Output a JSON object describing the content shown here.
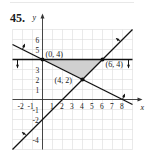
{
  "problem_number": "45.",
  "chart_data": {
    "type": "line",
    "title": "",
    "xlabel": "x",
    "ylabel": "y",
    "xlim": [
      -3,
      9
    ],
    "ylim": [
      -5,
      7
    ],
    "grid": true,
    "x_ticks": [
      "-2",
      "-1",
      "1",
      "2",
      "3",
      "4",
      "5",
      "6",
      "7",
      "8"
    ],
    "y_ticks": [
      "6",
      "5",
      "3",
      "2",
      "1",
      "-1",
      "-2",
      "-4"
    ],
    "lines": [
      {
        "name": "y = 4",
        "points": [
          [
            -3,
            4
          ],
          [
            9,
            4
          ]
        ],
        "shade_direction": "below"
      },
      {
        "name": "x + 2y = 8",
        "points": [
          [
            -3,
            5.5
          ],
          [
            9,
            -0.5
          ]
        ],
        "shade_direction": "above"
      },
      {
        "name": "x - y = 2",
        "points": [
          [
            -3,
            -5
          ],
          [
            9,
            7
          ]
        ],
        "shade_direction": "left/above"
      }
    ],
    "feasible_region": {
      "vertices": [
        [
          0,
          4
        ],
        [
          6,
          4
        ],
        [
          4,
          2
        ]
      ],
      "fill": "#d0d0d0"
    },
    "vertices": [
      {
        "label": "(0, 4)",
        "x": 0,
        "y": 4
      },
      {
        "label": "(6, 4)",
        "x": 6,
        "y": 4
      },
      {
        "label": "(4, 2)",
        "x": 4,
        "y": 2
      }
    ]
  }
}
